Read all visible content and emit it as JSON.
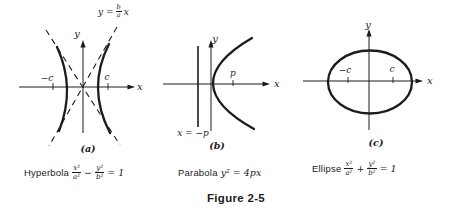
{
  "figure_title": "Figure 2-5",
  "panels": {
    "a": {
      "panel_label": "(a)",
      "x_axis": "x",
      "y_axis": "y",
      "focus_left": "−c",
      "focus_right": "c",
      "asymptote_label": {
        "lhs": "y =",
        "num": "b",
        "den": "a",
        "rhs": "x"
      },
      "caption": {
        "name": "Hyperbola",
        "frac1_num": "x²",
        "frac1_den": "a²",
        "operator": "−",
        "frac2_num": "y²",
        "frac2_den": "b²",
        "rhs": "= 1"
      }
    },
    "b": {
      "panel_label": "(b)",
      "x_axis": "x",
      "y_axis": "y",
      "focus_label": "p",
      "directrix_label": "x = −p",
      "caption": {
        "name": "Parabola",
        "formula": "y² = 4px"
      }
    },
    "c": {
      "panel_label": "(c)",
      "x_axis": "x",
      "y_axis": "y",
      "focus_left": "−c",
      "focus_right": "c",
      "caption": {
        "name": "Ellipse",
        "frac1_num": "x²",
        "frac1_den": "a²",
        "operator": "+",
        "frac2_num": "y²",
        "frac2_den": "b²",
        "rhs": "= 1"
      }
    }
  },
  "colors": {
    "ink": "#1c1c1c",
    "background": "#ffffff"
  }
}
